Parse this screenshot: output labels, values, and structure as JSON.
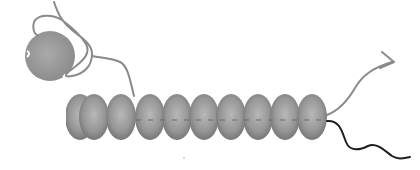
{
  "diagram": {
    "colors": {
      "background": "#ffffff",
      "bead_light": "#b4b4b4",
      "bead_mid": "#8e8e8e",
      "bead_dark": "#6e6e6e",
      "globule": "#9a9a9a",
      "strand_gray": "#8a8a8a",
      "strand_dark": "#1e1e1e"
    },
    "globule": {
      "cx": 50,
      "cy": 56,
      "r": 25
    },
    "bead_chain": {
      "count": 10,
      "first_cx": 80,
      "spacing": 27.5,
      "cy": 117,
      "rx": 15,
      "ry": 23,
      "first_bead_truncated": true
    },
    "tails": [
      {
        "name": "gray-arrow-tail",
        "color": "#8a8a8a",
        "has_arrowhead": true
      },
      {
        "name": "black-wavy-tail",
        "color": "#1e1e1e",
        "has_arrowhead": false
      }
    ],
    "labels": []
  }
}
